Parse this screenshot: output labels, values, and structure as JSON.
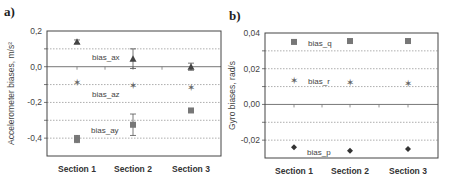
{
  "chart_data": [
    {
      "panel": "a)",
      "type": "scatter",
      "title": "",
      "xlabel": "",
      "ylabel": "Accelerometer biases, m/s²",
      "categories": [
        "Section 1",
        "Section 2",
        "Section 3"
      ],
      "ylim": [
        -0.5,
        0.2
      ],
      "yticks": [
        "0,2",
        "0,0",
        "-0,2",
        "-0,4"
      ],
      "grid": "dotted horizontal at 0.1 steps",
      "series": [
        {
          "name": "bias_ax",
          "marker": "triangle",
          "values": [
            0.14,
            0.045,
            0.0
          ],
          "errors": [
            0.01,
            0.055,
            0.02
          ]
        },
        {
          "name": "bias_az",
          "marker": "star",
          "values": [
            -0.09,
            -0.105,
            -0.115
          ],
          "errors": [
            0.0,
            0.0,
            0.0
          ]
        },
        {
          "name": "bias_ay",
          "marker": "square",
          "values": [
            -0.405,
            -0.325,
            -0.245
          ],
          "errors": [
            0.02,
            0.06,
            0.01
          ]
        }
      ]
    },
    {
      "panel": "b)",
      "type": "scatter",
      "title": "",
      "xlabel": "",
      "ylabel": "Gyro biases, rad/s",
      "categories": [
        "Section 1",
        "Section 2",
        "Section 3"
      ],
      "ylim": [
        -0.03,
        0.04
      ],
      "yticks": [
        "0,04",
        "0,02",
        "0,00",
        "-0,02"
      ],
      "grid": "dotted horizontal at 0.01 steps",
      "series": [
        {
          "name": "bias_q",
          "marker": "square",
          "values": [
            0.035,
            0.0355,
            0.0355
          ]
        },
        {
          "name": "bias_r",
          "marker": "star",
          "values": [
            0.0135,
            0.0125,
            0.012
          ]
        },
        {
          "name": "bias_p",
          "marker": "diamond",
          "values": [
            -0.024,
            -0.026,
            -0.025
          ]
        }
      ]
    }
  ]
}
